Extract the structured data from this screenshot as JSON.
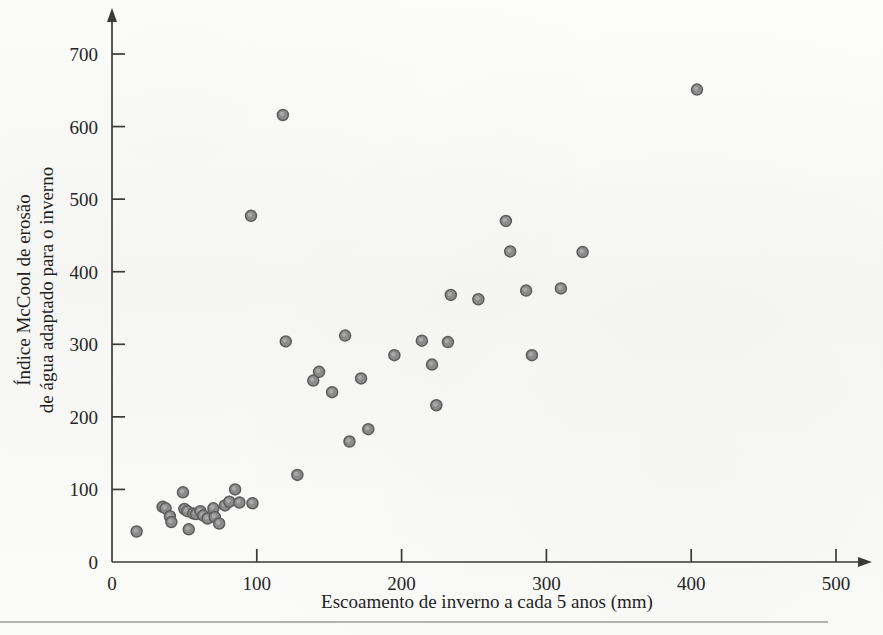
{
  "chart_data": {
    "type": "scatter",
    "title": "",
    "xlabel": "Escoamento de inverno a cada 5 anos (mm)",
    "ylabel_line1": "Índice McCool de erosão",
    "ylabel_line2": "de água adaptado para o inverno",
    "xlim": [
      0,
      500
    ],
    "ylim": [
      0,
      740
    ],
    "xticks": [
      0,
      100,
      200,
      300,
      400,
      500
    ],
    "yticks": [
      0,
      100,
      200,
      300,
      400,
      500,
      600,
      700
    ],
    "xtick_labels": [
      "0",
      "100",
      "200",
      "300",
      "400",
      "500"
    ],
    "ytick_labels": [
      "0",
      "100",
      "200",
      "300",
      "400",
      "500",
      "600",
      "700"
    ],
    "grid": false,
    "legend": false,
    "marker_color": "#8b8b8b",
    "marker_edge_color": "#5d5d5d",
    "marker_size": 11,
    "n_points": 42,
    "points": [
      {
        "x": 17,
        "y": 42
      },
      {
        "x": 35,
        "y": 76
      },
      {
        "x": 37,
        "y": 74
      },
      {
        "x": 40,
        "y": 63
      },
      {
        "x": 41,
        "y": 55
      },
      {
        "x": 49,
        "y": 96
      },
      {
        "x": 50,
        "y": 73
      },
      {
        "x": 52,
        "y": 70
      },
      {
        "x": 53,
        "y": 45
      },
      {
        "x": 56,
        "y": 67
      },
      {
        "x": 58,
        "y": 66
      },
      {
        "x": 61,
        "y": 70
      },
      {
        "x": 63,
        "y": 64
      },
      {
        "x": 66,
        "y": 60
      },
      {
        "x": 70,
        "y": 74
      },
      {
        "x": 71,
        "y": 62
      },
      {
        "x": 74,
        "y": 53
      },
      {
        "x": 78,
        "y": 78
      },
      {
        "x": 81,
        "y": 83
      },
      {
        "x": 85,
        "y": 100
      },
      {
        "x": 88,
        "y": 82
      },
      {
        "x": 97,
        "y": 81
      },
      {
        "x": 96,
        "y": 477
      },
      {
        "x": 118,
        "y": 616
      },
      {
        "x": 120,
        "y": 304
      },
      {
        "x": 128,
        "y": 120
      },
      {
        "x": 139,
        "y": 250
      },
      {
        "x": 143,
        "y": 262
      },
      {
        "x": 152,
        "y": 234
      },
      {
        "x": 161,
        "y": 312
      },
      {
        "x": 164,
        "y": 166
      },
      {
        "x": 172,
        "y": 253
      },
      {
        "x": 177,
        "y": 183
      },
      {
        "x": 195,
        "y": 285
      },
      {
        "x": 214,
        "y": 305
      },
      {
        "x": 221,
        "y": 272
      },
      {
        "x": 224,
        "y": 216
      },
      {
        "x": 232,
        "y": 303
      },
      {
        "x": 234,
        "y": 368
      },
      {
        "x": 253,
        "y": 362
      },
      {
        "x": 272,
        "y": 470
      },
      {
        "x": 275,
        "y": 428
      },
      {
        "x": 286,
        "y": 374
      },
      {
        "x": 290,
        "y": 285
      },
      {
        "x": 310,
        "y": 377
      },
      {
        "x": 325,
        "y": 427
      },
      {
        "x": 404,
        "y": 651
      }
    ]
  }
}
